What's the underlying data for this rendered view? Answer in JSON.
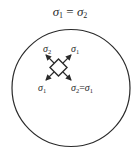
{
  "title": {
    "sym_a": "σ",
    "sub_a": "1",
    "eq": " = ",
    "sym_b": "σ",
    "sub_b": "2"
  },
  "diagram": {
    "shape": "circle",
    "element": "stress-element-rotated-45",
    "labels": {
      "upper_left": {
        "sym": "σ",
        "sub": "2"
      },
      "upper_right": {
        "sym": "σ",
        "sub": "1"
      },
      "lower_left": {
        "sym": "σ",
        "sub": "1"
      },
      "lower_right": {
        "sym_a": "σ",
        "sub_a": "2",
        "eq": "=",
        "sym_b": "σ",
        "sub_b": "1"
      }
    },
    "colors": {
      "stroke": "#2a2a2a",
      "background": "#ffffff"
    }
  }
}
